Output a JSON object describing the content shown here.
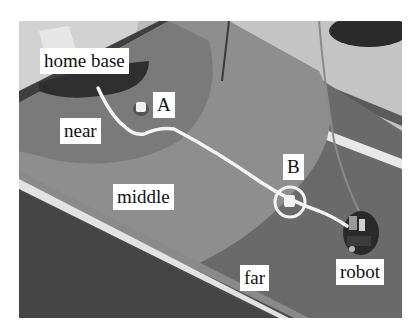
{
  "figure": {
    "labels": {
      "home_base": "home base",
      "near": "near",
      "middle": "middle",
      "far": "far",
      "robot": "robot",
      "landmark_a": "A",
      "landmark_b": "B"
    },
    "colors": {
      "background": "#ffffff",
      "home_base_region": "#3a3a3a",
      "near_region": "#7c7c7c",
      "middle_region": "#8c8c8c",
      "far_region": "#6a6a6a",
      "table_rim": "#5a5a5a",
      "path": "#f4f4f4",
      "label_bg": "#ffffff",
      "label_text": "#111111"
    }
  }
}
